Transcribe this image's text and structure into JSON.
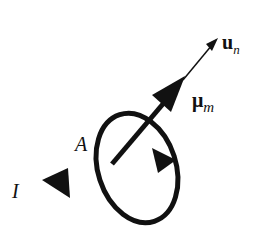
{
  "diagram": {
    "labels": {
      "unit_normal": {
        "symbol": "u",
        "subscript": "n"
      },
      "magnetic_moment": {
        "symbol": "μ",
        "subscript": "m"
      },
      "area": "A",
      "current": "I"
    },
    "colors": {
      "stroke": "#111111",
      "background": "#ffffff"
    }
  }
}
